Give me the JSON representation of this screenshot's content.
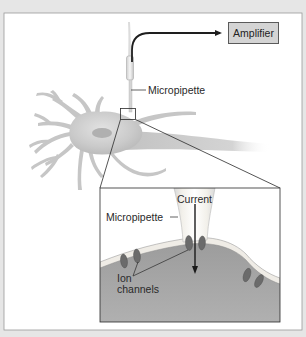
{
  "figure": {
    "colors": {
      "background": "#e6e6e6",
      "panel": "#ffffff",
      "neuron": "#c8c8c8",
      "cytoplasm": "#a9a9a9",
      "membrane": "#ebe8e2",
      "ion_channel": "#6e6e6e",
      "amplifier_fill": "#d4d4d4"
    }
  },
  "labels": {
    "amplifier": "Amplifier",
    "micropipette_main": "Micropipette",
    "micropipette_inset": "Micropipette",
    "current": "Current",
    "ion_channels_line1": "Ion",
    "ion_channels_line2": "channels"
  }
}
